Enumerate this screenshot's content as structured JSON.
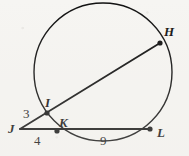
{
  "figure": {
    "type": "circle-secants-geometry-diagram",
    "background_color": "#f6f5f2",
    "stroke_color": "#111111",
    "circle": {
      "cx": 103,
      "cy": 72,
      "r": 69
    },
    "points": [
      {
        "id": "J",
        "label": "J",
        "x": 20,
        "y": 129,
        "on_circle": false,
        "dot": false,
        "label_x": 8,
        "label_y": 124
      },
      {
        "id": "I",
        "label": "I",
        "x": 47,
        "y": 113,
        "on_circle": true,
        "dot": true,
        "label_x": 45,
        "label_y": 96
      },
      {
        "id": "K",
        "label": "K",
        "x": 57,
        "y": 131,
        "on_circle": true,
        "dot": true,
        "label_x": 59,
        "label_y": 116
      },
      {
        "id": "H",
        "label": "H",
        "x": 160,
        "y": 43,
        "on_circle": true,
        "dot": true,
        "label_x": 165,
        "label_y": 26
      },
      {
        "id": "L",
        "label": "L",
        "x": 150,
        "y": 129,
        "on_circle": true,
        "dot": true,
        "label_x": 158,
        "label_y": 128
      }
    ],
    "segments": [
      {
        "id": "secant-JH",
        "from": "J",
        "to": "H",
        "x1": 20,
        "y1": 129,
        "x2": 160,
        "y2": 43
      },
      {
        "id": "secant-JL",
        "from": "J",
        "to": "L",
        "x1": 20,
        "y1": 129,
        "x2": 150,
        "y2": 129
      }
    ],
    "measures": [
      {
        "id": "measure-JI",
        "value": "3",
        "segment": "JI",
        "x": 23,
        "y": 107
      },
      {
        "id": "measure-JK",
        "value": "4",
        "segment": "JK",
        "x": 34,
        "y": 134
      },
      {
        "id": "measure-KL",
        "value": "9",
        "segment": "KL",
        "x": 101,
        "y": 134
      }
    ]
  }
}
